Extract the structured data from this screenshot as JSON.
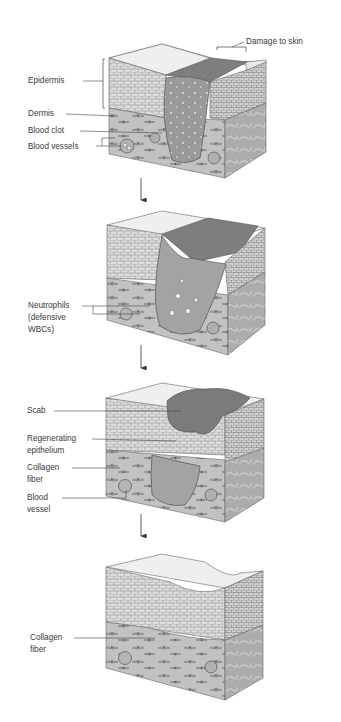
{
  "figure": {
    "panels": [
      {
        "stage": 1,
        "labels": {
          "damage": "Damage to skin",
          "epidermis": "Epidermis",
          "dermis": "Dermis",
          "blood_clot": "Blood clot",
          "blood_vessels": "Blood vessels"
        }
      },
      {
        "stage": 2,
        "labels": {
          "neutrophils_line1": "Neutrophils",
          "neutrophils_line2": "(defensive",
          "neutrophils_line3": "WBCs)"
        }
      },
      {
        "stage": 3,
        "labels": {
          "scab": "Scab",
          "regen_line1": "Regenerating",
          "regen_line2": "epithelium",
          "collagen_line1": "Collagen",
          "collagen_line2": "fiber",
          "vessel_line1": "Blood",
          "vessel_line2": "vessel"
        }
      },
      {
        "stage": 4,
        "labels": {
          "collagen_line1": "Collagen",
          "collagen_line2": "fiber"
        }
      }
    ],
    "arrows": [
      "arrow-1-to-2",
      "arrow-2-to-3",
      "arrow-3-to-4"
    ],
    "colors": {
      "epidermis": "#d9d9d9",
      "dermis": "#bdbdbd",
      "top_surface": "#ececec",
      "clot": "#8f8f8f",
      "scab": "#7b7b7b",
      "side_face": "#a9a9a9",
      "line": "#555555"
    }
  }
}
